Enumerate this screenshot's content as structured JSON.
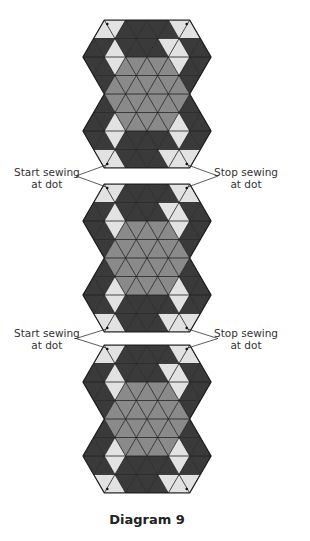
{
  "caption": "Diagram 9",
  "colors": {
    "dark": "#3a3a3a",
    "medium": "#8a8a8a",
    "light": "#e2e2e2",
    "line": "#1e1e1e",
    "text": "#333333"
  },
  "blocks": [
    {
      "id": 1,
      "top": 20,
      "bottom": 168,
      "center_x": 147
    },
    {
      "id": 2,
      "top": 184,
      "bottom": 332,
      "center_x": 147
    },
    {
      "id": 3,
      "top": 345,
      "bottom": 493,
      "center_x": 147
    }
  ],
  "seams": [
    {
      "between": [
        1,
        2
      ],
      "left_label_line1": "Start sewing",
      "left_label_line2": "at dot",
      "right_label_line1": "Stop sewing",
      "right_label_line2": "at dot"
    },
    {
      "between": [
        2,
        3
      ],
      "left_label_line1": "Start sewing",
      "left_label_line2": "at dot",
      "right_label_line1": "Stop sewing",
      "right_label_line2": "at dot"
    }
  ]
}
